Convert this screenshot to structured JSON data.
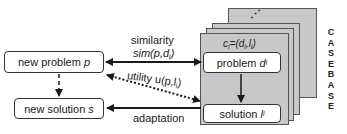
{
  "diagram": {
    "type": "case-based-reasoning-cycle",
    "nodes": {
      "new_problem": {
        "label": "new problem",
        "var": "p"
      },
      "new_solution": {
        "label": "new solution",
        "var": "s"
      },
      "case_problem": {
        "label": "problem",
        "var": "d",
        "sub": "i"
      },
      "case_solution": {
        "label": "solution",
        "var": "l",
        "sub": "i"
      }
    },
    "case_label": {
      "prefix": "c",
      "prefix_sub": "i",
      "rest": "=(d",
      "d_sub": "i",
      "comma": ",l",
      "l_sub": "i",
      "close": ")"
    },
    "ellipsis": "⋰",
    "edges": {
      "similarity": {
        "label": "similarity",
        "formula": "sim(p,d",
        "formula_sub": "i",
        "formula_close": ")",
        "style": "solid",
        "direction": "bidirectional"
      },
      "utility": {
        "label": "utility",
        "formula": "u(p,l",
        "formula_sub": "i",
        "formula_close": ")",
        "style": "dotted",
        "direction": "bidirectional"
      },
      "adaptation": {
        "label": "adaptation",
        "style": "solid",
        "direction": "to-new-solution"
      },
      "problem_to_solution_new": {
        "style": "dashed"
      },
      "problem_to_solution_case": {
        "style": "solid"
      }
    },
    "casebase_letters": [
      "C",
      "A",
      "S",
      "E",
      "B",
      "A",
      "S",
      "E"
    ],
    "colors": {
      "card_fill": "#c8c8c8",
      "stroke": "#1a1a1a",
      "node_fill": "#ffffff"
    }
  }
}
